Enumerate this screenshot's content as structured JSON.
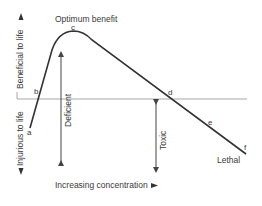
{
  "diagram": {
    "title_peak": "Optimum benefit",
    "axes": {
      "y_up_label": "Beneficial to life",
      "y_down_label": "Injurious to life",
      "x_label": "Increasing concentration"
    },
    "zones": {
      "deficient": "Deficient",
      "toxic": "Toxic",
      "lethal": "Lethal"
    },
    "points": {
      "a": "a",
      "b": "b",
      "c": "c",
      "d": "d",
      "e": "e",
      "f": "f"
    },
    "colors": {
      "curve": "#333333",
      "baseline": "#aaaaaa",
      "arrows": "#444444"
    }
  }
}
